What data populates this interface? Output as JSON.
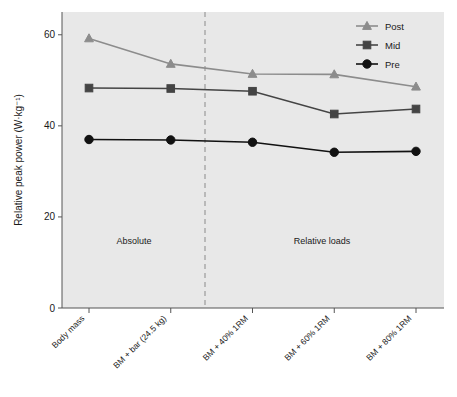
{
  "chart_data": {
    "type": "line",
    "title": "",
    "xlabel": "",
    "ylabel": "Relative peak power (W·kg⁻¹)",
    "ylim": [
      0,
      65
    ],
    "yticks": [
      0,
      20,
      40,
      60
    ],
    "ytick_labels": [
      "0",
      "20",
      "40",
      "60"
    ],
    "grid": false,
    "legend_position": "top-right",
    "categories": [
      "Body mass",
      "BM + bar (24.5 kg)",
      "BM + 40% 1RM",
      "BM + 60% 1RM",
      "BM + 80% 1RM"
    ],
    "series": [
      {
        "name": "Post",
        "marker": "triangle",
        "color": "#8c8c8c",
        "values": [
          59.2,
          53.6,
          51.4,
          51.3,
          48.6
        ]
      },
      {
        "name": "Mid",
        "marker": "square",
        "color": "#444444",
        "values": [
          48.3,
          48.2,
          47.6,
          42.6,
          43.7
        ]
      },
      {
        "name": "Pre",
        "marker": "circle",
        "color": "#111111",
        "values": [
          37.0,
          36.9,
          36.4,
          34.2,
          34.4
        ]
      }
    ],
    "annotations": [
      {
        "text": "Absolute",
        "x_category_span": "Body mass to BM + bar (24.5 kg)",
        "y": 15.5
      },
      {
        "text": "Relative loads",
        "x_category_span": "BM + 40% 1RM to BM + 80% 1RM",
        "y": 15.5
      }
    ],
    "divider": {
      "type": "vertical-dashed-line",
      "between": [
        "BM + bar (24.5 kg)",
        "BM + 40% 1RM"
      ],
      "color": "#999999"
    },
    "plot_background": "#e8e8e8"
  },
  "legend": {
    "entries": [
      {
        "label": "Post"
      },
      {
        "label": "Mid"
      },
      {
        "label": "Pre"
      }
    ]
  },
  "axes": {
    "y_label": "Relative peak power (W·kg⁻¹)",
    "y_ticks": [
      "60",
      "40",
      "20",
      "0"
    ],
    "x_ticks": [
      "Body mass",
      "BM + bar (24.5 kg)",
      "BM + 40% 1RM",
      "BM + 60% 1RM",
      "BM + 80% 1RM"
    ]
  },
  "annotations": {
    "absolute": "Absolute",
    "relative": "Relative loads"
  }
}
